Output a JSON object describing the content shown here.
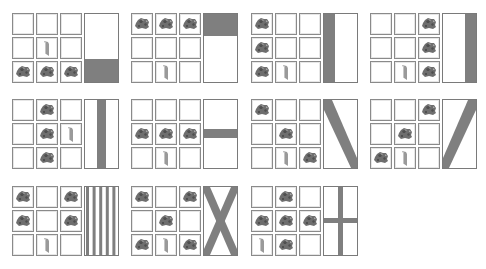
{
  "colors": {
    "pattern": "#7f7f7f",
    "cell_border": "#8a8a8a",
    "banner_border": "#7a7a7a",
    "ore": "#6e6e6e",
    "stick": "#9a9a9a"
  },
  "legend": {
    "ore": "dye-item",
    "stick": "banner-item",
    "empty": "empty-slot"
  },
  "recipes": [
    {
      "name": "base",
      "grid": [
        "",
        "",
        "",
        "",
        "stick",
        "",
        "ore",
        "ore",
        "ore"
      ],
      "pattern": "bottom-stripe"
    },
    {
      "name": "chief",
      "grid": [
        "ore",
        "ore",
        "ore",
        "",
        "",
        "",
        "",
        "stick",
        ""
      ],
      "pattern": "top-stripe"
    },
    {
      "name": "pale-dexter",
      "grid": [
        "ore",
        "",
        "",
        "ore",
        "",
        "",
        "ore",
        "stick",
        ""
      ],
      "pattern": "left-stripe"
    },
    {
      "name": "pale-sinister",
      "grid": [
        "",
        "",
        "ore",
        "",
        "",
        "ore",
        "",
        "stick",
        "ore"
      ],
      "pattern": "right-stripe"
    },
    {
      "name": "pale",
      "grid": [
        "",
        "ore",
        "",
        "",
        "ore",
        "stick",
        "",
        "ore",
        ""
      ],
      "pattern": "center-stripe"
    },
    {
      "name": "fess",
      "grid": [
        "",
        "",
        "",
        "ore",
        "ore",
        "ore",
        "",
        "stick",
        ""
      ],
      "pattern": "middle-stripe"
    },
    {
      "name": "bend",
      "grid": [
        "ore",
        "",
        "",
        "",
        "ore",
        "",
        "",
        "stick",
        "ore"
      ],
      "pattern": "down-right-diagonal"
    },
    {
      "name": "bend-sinister",
      "grid": [
        "",
        "",
        "ore",
        "",
        "ore",
        "",
        "ore",
        "stick",
        ""
      ],
      "pattern": "down-left-diagonal"
    },
    {
      "name": "paly",
      "grid": [
        "ore",
        "",
        "ore",
        "ore",
        "",
        "ore",
        "",
        "stick",
        ""
      ],
      "pattern": "small-stripes"
    },
    {
      "name": "saltire",
      "grid": [
        "ore",
        "",
        "ore",
        "",
        "ore",
        "",
        "ore",
        "stick",
        "ore"
      ],
      "pattern": "diagonal-cross"
    },
    {
      "name": "cross",
      "grid": [
        "",
        "ore",
        "",
        "ore",
        "ore",
        "ore",
        "stick",
        "ore",
        ""
      ],
      "pattern": "square-cross"
    }
  ]
}
